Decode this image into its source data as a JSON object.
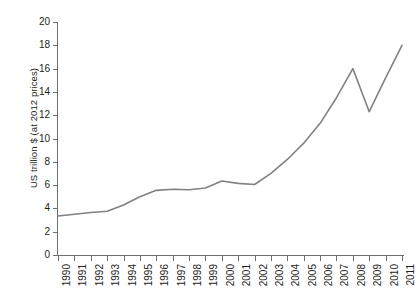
{
  "chart_data": {
    "type": "line",
    "title": "",
    "xlabel": "",
    "ylabel": "US trillion $ (at 2012 prices)",
    "xlim": [
      1990,
      2011
    ],
    "ylim": [
      0,
      20
    ],
    "ytick_step": 2,
    "grid": false,
    "legend": "none",
    "line_color": "#808285",
    "categories": [
      "1990",
      "1991",
      "1992",
      "1993",
      "1994",
      "1995",
      "1996",
      "1997",
      "1998",
      "1999",
      "2000",
      "2001",
      "2002",
      "2003",
      "2004",
      "2005",
      "2006",
      "2007",
      "2008",
      "2009",
      "2010",
      "2011"
    ],
    "yticks": [
      "0",
      "2",
      "4",
      "6",
      "8",
      "10",
      "12",
      "14",
      "16",
      "18",
      "20"
    ],
    "series": [
      {
        "name": "US trillion $ (at 2012 prices)",
        "values": [
          3.35,
          3.5,
          3.65,
          3.75,
          4.3,
          5.0,
          5.55,
          5.65,
          5.6,
          5.75,
          6.35,
          6.15,
          6.05,
          7.0,
          8.2,
          9.6,
          11.3,
          13.5,
          16.0,
          12.3,
          15.2,
          18.0
        ]
      }
    ]
  }
}
